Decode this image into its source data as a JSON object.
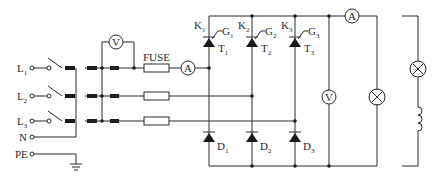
{
  "diagram": {
    "type": "circuit-schematic",
    "inputs": [
      {
        "label": "L",
        "sub": "1"
      },
      {
        "label": "L",
        "sub": "2"
      },
      {
        "label": "L",
        "sub": "3"
      },
      {
        "label": "N",
        "sub": ""
      },
      {
        "label": "PE",
        "sub": ""
      }
    ],
    "fuse_label": "FUSE",
    "meters": {
      "input_voltmeter": "V",
      "input_ammeter": "A",
      "output_ammeter": "A",
      "output_voltmeter": "V"
    },
    "thyristors": [
      {
        "k": "K",
        "k_sub": "1",
        "g": "G",
        "g_sub": "1",
        "t": "T",
        "t_sub": "1"
      },
      {
        "k": "K",
        "k_sub": "2",
        "g": "G",
        "g_sub": "2",
        "t": "T",
        "t_sub": "2"
      },
      {
        "k": "K",
        "k_sub": "3",
        "g": "G",
        "g_sub": "3",
        "t": "T",
        "t_sub": "3"
      }
    ],
    "diodes": [
      {
        "d": "D",
        "d_sub": "1"
      },
      {
        "d": "D",
        "d_sub": "2"
      },
      {
        "d": "D",
        "d_sub": "3"
      }
    ],
    "loads": [
      "resistive-lamp-load",
      "inductive-lamp-coil-load"
    ],
    "colors": {
      "line": "#2a2a2a",
      "background": "#ffffff"
    }
  }
}
